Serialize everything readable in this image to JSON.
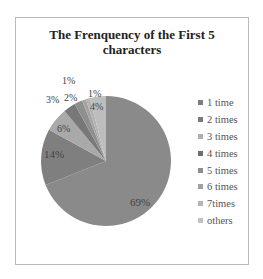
{
  "chart_data": {
    "type": "pie",
    "title": "The Frenquency of the First 5 characters",
    "categories": [
      "1 time",
      "2 times",
      "3 times",
      "4 times",
      "5 times",
      "6 times",
      "7times",
      "others"
    ],
    "values": [
      69,
      14,
      6,
      3,
      2,
      1,
      1,
      4
    ],
    "data_labels": [
      "69%",
      "14%",
      "6%",
      "3%",
      "2%",
      "1%",
      "1%",
      "4%"
    ],
    "colors": [
      "#8a8a8a",
      "#7f7f7f",
      "#a9a9a9",
      "#787878",
      "#8f8f8f",
      "#a4a4a4",
      "#b3b3b3",
      "#bdbdbd"
    ],
    "legend_position": "right",
    "start_angle": "12 o'clock, clockwise"
  },
  "title_line1": "The Frenquency of the First 5",
  "title_line2": "characters",
  "legend": [
    {
      "label": "1 time",
      "color": "#7e7e7e"
    },
    {
      "label": "2 times",
      "color": "#7a7a7a"
    },
    {
      "label": "3 times",
      "color": "#b0b0b0"
    },
    {
      "label": "4 times",
      "color": "#6f6f6f"
    },
    {
      "label": "5 times",
      "color": "#8e8e8e"
    },
    {
      "label": "6 times",
      "color": "#a0a0a0"
    },
    {
      "label": "7times",
      "color": "#b5b5b5"
    },
    {
      "label": "others",
      "color": "#c2c2c2"
    }
  ],
  "labels": {
    "p69": "69%",
    "p14": "14%",
    "p6": "6%",
    "p3": "3%",
    "p2": "2%",
    "p1a": "1%",
    "p1b": "1%",
    "p4": "4%"
  }
}
